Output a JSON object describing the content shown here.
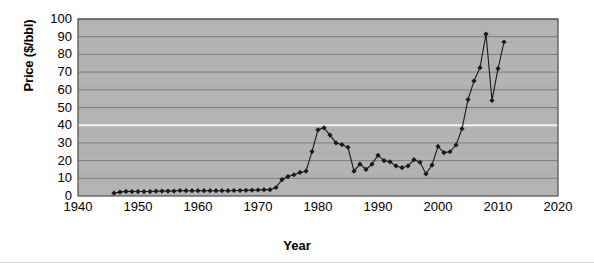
{
  "chart_data": {
    "type": "line",
    "title": "",
    "xlabel": "Year",
    "ylabel": "Price ($/bbl)",
    "xlim": [
      1940,
      2020
    ],
    "ylim": [
      0,
      100
    ],
    "xticks": [
      1940,
      1950,
      1960,
      1970,
      1980,
      1990,
      2000,
      2010,
      2020
    ],
    "yticks": [
      0,
      10,
      20,
      30,
      40,
      50,
      60,
      70,
      80,
      90,
      100
    ],
    "grid": "horizontal",
    "legend": "none",
    "marker": "diamond",
    "series": [
      {
        "name": "Crude oil price",
        "color": "#1a1a1a",
        "x": [
          1946,
          1947,
          1948,
          1949,
          1950,
          1951,
          1952,
          1953,
          1954,
          1955,
          1956,
          1957,
          1958,
          1959,
          1960,
          1961,
          1962,
          1963,
          1964,
          1965,
          1966,
          1967,
          1968,
          1969,
          1970,
          1971,
          1972,
          1973,
          1974,
          1975,
          1976,
          1977,
          1978,
          1979,
          1980,
          1981,
          1982,
          1983,
          1984,
          1985,
          1986,
          1987,
          1988,
          1989,
          1990,
          1991,
          1992,
          1993,
          1994,
          1995,
          1996,
          1997,
          1998,
          1999,
          2000,
          2001,
          2002,
          2003,
          2004,
          2005,
          2006,
          2007,
          2008,
          2009,
          2010,
          2011
        ],
        "y": [
          1.6,
          2.2,
          2.6,
          2.5,
          2.5,
          2.5,
          2.5,
          2.7,
          2.8,
          2.8,
          2.8,
          3.1,
          3.0,
          3.0,
          3.0,
          3.0,
          3.0,
          3.0,
          3.0,
          3.0,
          3.1,
          3.1,
          3.2,
          3.3,
          3.4,
          3.6,
          3.6,
          4.8,
          9.3,
          11.0,
          12.0,
          13.3,
          14.0,
          25.1,
          37.4,
          38.5,
          34.4,
          30.0,
          29.0,
          27.5,
          14.0,
          18.0,
          15.0,
          18.0,
          23.0,
          20.0,
          19.3,
          17.0,
          16.0,
          17.0,
          20.5,
          19.0,
          12.5,
          17.5,
          28.0,
          24.5,
          25.0,
          28.8,
          38.0,
          54.5,
          65.0,
          72.5,
          91.5,
          54.0,
          72.0,
          87.0
        ]
      }
    ]
  },
  "axis": {
    "y_title": "Price ($/bbl)",
    "x_title": "Year"
  }
}
